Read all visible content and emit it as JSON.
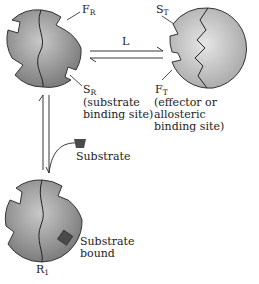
{
  "diagram": {
    "type": "allosteric-enzyme-equilibrium",
    "states": [
      {
        "id": "R",
        "label": "F",
        "label_sub": "R",
        "position": "top-left"
      },
      {
        "id": "T",
        "label": "S",
        "label_sub": "T",
        "position": "top-right"
      },
      {
        "id": "R1",
        "label": "R",
        "label_sub": "1",
        "position": "bottom-left"
      }
    ],
    "labels": {
      "fr": {
        "main": "F",
        "sub": "R"
      },
      "sr": {
        "main": "S",
        "sub": "R",
        "note_line1": "(substrate",
        "note_line2": "binding site)"
      },
      "st": {
        "main": "S",
        "sub": "T"
      },
      "ft": {
        "main": "F",
        "sub": "T",
        "note_line1": "(effector or",
        "note_line2": "allosteric",
        "note_line3": "binding site)"
      },
      "equilibrium_constant": "L",
      "substrate": "Substrate",
      "substrate_bound_line1": "Substrate",
      "substrate_bound_line2": "bound",
      "r1": {
        "main": "R",
        "sub": "1"
      }
    },
    "colors": {
      "enzyme_fill_dark": "#8a8a8a",
      "enzyme_fill_light": "#cfcfcf",
      "substrate": "#4a4a4a",
      "line": "#222222"
    }
  }
}
